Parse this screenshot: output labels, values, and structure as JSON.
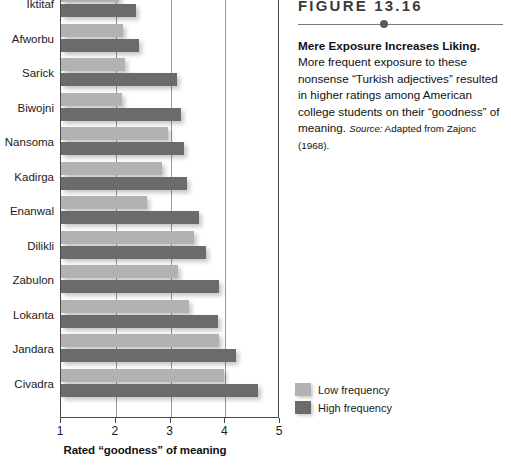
{
  "chart_data": {
    "type": "bar",
    "orientation": "horizontal",
    "title": "",
    "xlabel": "Rated “goodness” of meaning",
    "ylabel": "",
    "xlim": [
      1,
      5
    ],
    "xticks": [
      1,
      2,
      3,
      4,
      5
    ],
    "grid": true,
    "grid_axis": "x",
    "legend_position": "bottom-right-outside",
    "categories": [
      "Iktitaf",
      "Afworbu",
      "Sarick",
      "Biwojni",
      "Nansoma",
      "Kadirga",
      "Enanwal",
      "Dilikli",
      "Zabulon",
      "Lokanta",
      "Jandara",
      "Civadra"
    ],
    "series": [
      {
        "name": "Low frequency",
        "color": "#b2b2b2",
        "values": [
          2.06,
          2.13,
          2.16,
          2.11,
          2.96,
          2.85,
          2.57,
          3.43,
          3.13,
          3.34,
          3.89,
          3.98
        ]
      },
      {
        "name": "High frequency",
        "color": "#6b6b6b",
        "values": [
          2.37,
          2.42,
          3.12,
          3.2,
          3.25,
          3.3,
          3.52,
          3.65,
          3.89,
          3.87,
          4.19,
          4.6
        ]
      }
    ]
  },
  "legend": {
    "entries": [
      {
        "label": "Low frequency",
        "color": "#b2b2b2"
      },
      {
        "label": "High frequency",
        "color": "#6b6b6b"
      }
    ]
  },
  "axis": {
    "x_title": "Rated “goodness” of meaning",
    "tick_labels": [
      "1",
      "2",
      "3",
      "4",
      "5"
    ]
  },
  "caption": {
    "figure_number": "FIGURE 13.16",
    "headline": "Mere Exposure Increases Liking.",
    "body": " More frequent exposure to these nonsense “Turkish adjectives” resulted in higher ratings among American college students on their “goodness” of meaning. ",
    "source_label": "Source:",
    "source_text": " Adapted from Zajonc (1968)."
  }
}
